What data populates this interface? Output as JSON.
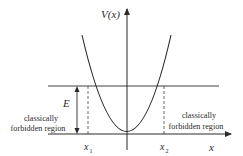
{
  "diagram": {
    "labels": {
      "y_axis": "V(x)",
      "x_axis": "x",
      "energy": "E",
      "x1": "x",
      "x1_sub": "1",
      "x2": "x",
      "x2_sub": "2",
      "left_region_line1": "classically",
      "left_region_line2": "forbidden region",
      "right_region_line1": "classically",
      "right_region_line2": "forbidden region"
    },
    "colors": {
      "line": "#2a2a2a",
      "background": "#ffffff"
    }
  }
}
